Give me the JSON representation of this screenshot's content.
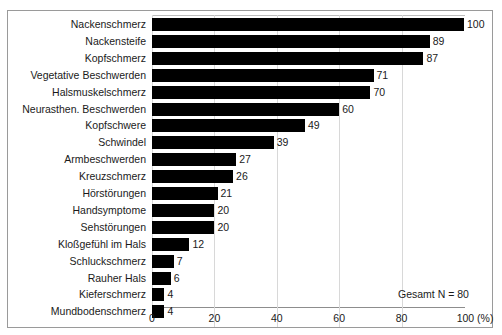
{
  "chart_data": {
    "type": "bar",
    "orientation": "horizontal",
    "title": "",
    "subtitle": "",
    "xlabel": "(%)",
    "ylabel": "",
    "xlim": [
      0,
      100
    ],
    "grid": true,
    "gridlines_at": [
      20,
      40,
      60,
      80
    ],
    "legend": "none",
    "xticks": [
      "0",
      "20",
      "40",
      "60",
      "80",
      "100 (%)"
    ],
    "xtick_values": [
      0,
      20,
      40,
      60,
      80,
      100
    ],
    "bar_color": "#000000",
    "categories": [
      "Nackenschmerz",
      "Nackensteife",
      "Kopfschmerz",
      "Vegetative Beschwerden",
      "Halsmuskelschmerz",
      "Neurasthen. Beschwerden",
      "Kopfschwere",
      "Schwindel",
      "Armbeschwerden",
      "Kreuzschmerz",
      "Hörstörungen",
      "Handsymptome",
      "Sehstörungen",
      "Kloßgefühl im Hals",
      "Schluckschmerz",
      "Rauher Hals",
      "Kieferschmerz",
      "Mundbodenschmerz"
    ],
    "values": [
      100,
      89,
      87,
      71,
      70,
      60,
      49,
      39,
      27,
      26,
      21,
      20,
      20,
      12,
      7,
      6,
      4,
      4
    ],
    "value_labels": [
      "100",
      "89",
      "87",
      "71",
      "70",
      "60",
      "49",
      "39",
      "27",
      "26",
      "21",
      "20",
      "20",
      "12",
      "7",
      "6",
      "4",
      "4"
    ],
    "annotations": [
      {
        "text": "Gesamt N = 80",
        "position": "bottom-right"
      }
    ]
  },
  "annotation": {
    "total_note": "Gesamt N = 80"
  }
}
